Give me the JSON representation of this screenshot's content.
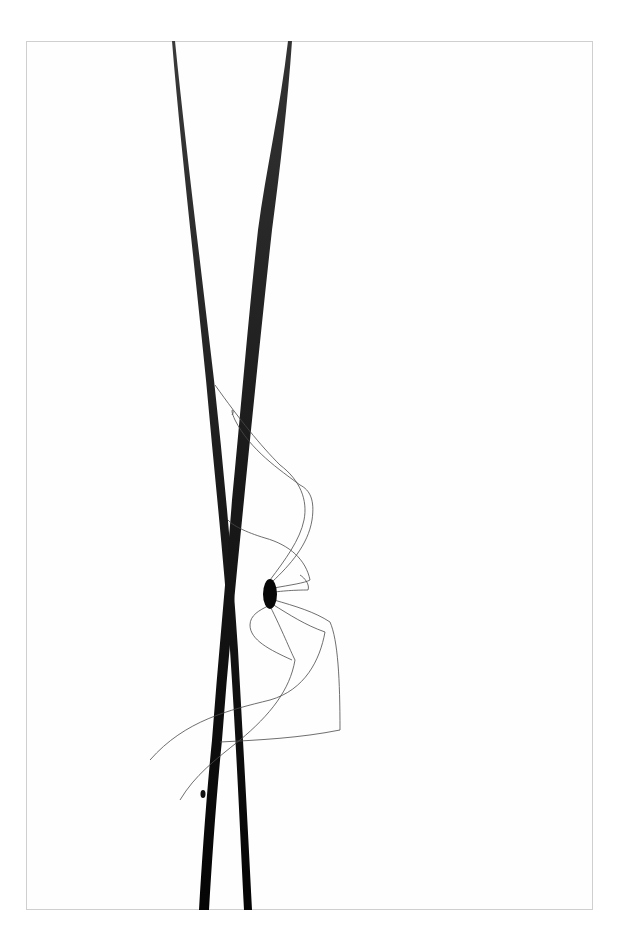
{
  "image": {
    "subject": "Harvestman spider on two crossing grass blades",
    "background_color": "#ffffff",
    "frame_border_color": "#cfcfcf",
    "blade_color": "#111111",
    "leg_color": "#555555"
  }
}
